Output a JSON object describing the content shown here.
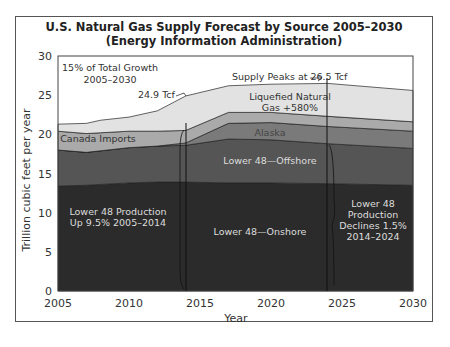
{
  "chart_data": {
    "type": "area",
    "stacked": true,
    "title": "U.S. Natural Gas Supply Forecast by Source 2005–2030",
    "subtitle": "(Energy Information Administration)",
    "xlabel": "Year",
    "ylabel": "Trillion cubic feet per year",
    "xlim": [
      2005,
      2030
    ],
    "ylim": [
      0,
      30
    ],
    "x_ticks": [
      "2005",
      "2010",
      "2015",
      "2020",
      "2025",
      "2030"
    ],
    "y_ticks": [
      "0",
      "5",
      "10",
      "15",
      "20",
      "25",
      "30"
    ],
    "grid": false,
    "x": [
      2005,
      2007,
      2008,
      2010,
      2012,
      2014,
      2017,
      2020,
      2024,
      2030
    ],
    "series": [
      {
        "name": "Lower 48—Onshore",
        "color": "#2b2b2b",
        "values": [
          13.4,
          13.5,
          13.6,
          13.8,
          13.9,
          13.9,
          13.8,
          13.8,
          13.7,
          13.5
        ]
      },
      {
        "name": "Lower 48—Offshore",
        "color": "#555555",
        "values": [
          4.6,
          4.2,
          4.3,
          4.5,
          4.6,
          4.7,
          5.6,
          5.5,
          5.1,
          4.7
        ]
      },
      {
        "name": "Alaska",
        "color": "#7a7a7a",
        "values": [
          0.0,
          0.0,
          0.0,
          0.0,
          0.0,
          0.3,
          2.0,
          2.2,
          2.2,
          2.2
        ]
      },
      {
        "name": "Canada Imports",
        "color": "#aaaaaa",
        "values": [
          2.4,
          2.4,
          2.3,
          2.1,
          1.9,
          1.6,
          1.4,
          1.3,
          1.3,
          1.2
        ]
      },
      {
        "name": "Liquefied Natural Gas +580%",
        "color": "#e2e2e2",
        "values": [
          0.9,
          1.3,
          1.6,
          1.8,
          2.6,
          4.4,
          3.4,
          3.6,
          4.2,
          4.0
        ]
      }
    ],
    "totals": [
      21.3,
      21.4,
      21.8,
      22.2,
      23.0,
      24.9,
      26.2,
      26.4,
      26.5,
      25.6
    ],
    "annotations": [
      {
        "text": "15% of Total Growth\n2005–2030"
      },
      {
        "text": "24.9 Tcf",
        "x": 2014
      },
      {
        "text": "Supply Peaks at 26.5 Tcf",
        "x": 2024
      },
      {
        "text": "Lower 48 Production\nUp 9.5% 2005–2014"
      },
      {
        "text": "Lower 48\nProduction\nDeclines 1.5%\n2014–2024"
      }
    ],
    "markers": [
      {
        "x": 2014,
        "type": "vertical-line"
      },
      {
        "x": 2024,
        "type": "vertical-line"
      }
    ]
  },
  "labels": {
    "title": "U.S. Natural Gas Supply Forecast by Source 2005–2030",
    "subtitle": "(Energy Information Administration)",
    "xlabel": "Year",
    "ylabel": "Trillion cubic feet per year",
    "growth_1": "15% of Total Growth",
    "growth_2": "2005–2030",
    "tcf249": "24.9 Tcf",
    "peak": "Supply Peaks at 26.5 Tcf",
    "lng_1": "Liquefied Natural",
    "lng_2": "Gas +580%",
    "alaska": "Alaska",
    "canada": "Canada Imports",
    "offshore": "Lower 48—Offshore",
    "onshore": "Lower 48—Onshore",
    "up_1": "Lower 48 Production",
    "up_2": "Up 9.5% 2005–2014",
    "dec_1": "Lower 48",
    "dec_2": "Production",
    "dec_3": "Declines 1.5%",
    "dec_4": "2014–2024"
  }
}
